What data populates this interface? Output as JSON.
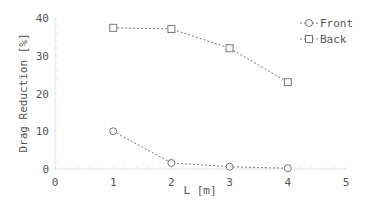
{
  "chart_data": {
    "type": "line",
    "title": "",
    "xlabel": "L [m]",
    "ylabel": "Drag Reduction [%]",
    "xlim": [
      0,
      5
    ],
    "ylim": [
      0,
      40
    ],
    "xticks": [
      0,
      1,
      2,
      3,
      4,
      5
    ],
    "yticks": [
      0,
      10,
      20,
      30,
      40
    ],
    "grid": false,
    "legend_position": "upper right",
    "x": [
      1,
      2,
      3,
      4
    ],
    "series": [
      {
        "name": "Front",
        "marker": "circle",
        "line": "dotted",
        "color": "#666666",
        "values": [
          10.0,
          1.6,
          0.6,
          0.2
        ]
      },
      {
        "name": "Back",
        "marker": "square",
        "line": "dotted",
        "color": "#666666",
        "values": [
          37.4,
          37.1,
          32.0,
          23.0
        ]
      }
    ]
  }
}
